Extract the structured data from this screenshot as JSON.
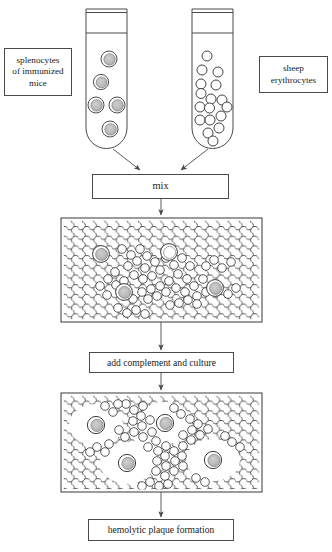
{
  "figure": {
    "type": "flow-diagram"
  },
  "labels": {
    "splenocytes_line1": "splenocytes",
    "splenocytes_line2": "of immunized",
    "splenocytes_line3": "mice",
    "erythrocytes_line1": "sheep",
    "erythrocytes_line2": "erythrocytes",
    "mix": "mix",
    "add_complement": "add complement and culture",
    "hemolytic": "hemolytic plaque formation"
  },
  "colors": {
    "stroke": "#4a4a4a",
    "cell_stroke": "#3a3a3a",
    "splenocyte_fill": "#b9b9b9",
    "erythrocyte_fill": "#ffffff",
    "background": "#ffffff",
    "text": "#1b1b1b"
  },
  "tubes": [
    {
      "name": "splenocyte-tube",
      "x": 86,
      "y": 9,
      "width": 41,
      "height": 139,
      "rim_y": 12,
      "neck_y": 33,
      "cell_type": "splenocyte",
      "cell_count": 5,
      "cells": [
        {
          "cx": 109,
          "cy": 59,
          "r": 8
        },
        {
          "cx": 101,
          "cy": 82,
          "r": 7.5
        },
        {
          "cx": 96,
          "cy": 105,
          "r": 8
        },
        {
          "cx": 117,
          "cy": 105,
          "r": 8
        },
        {
          "cx": 110,
          "cy": 129,
          "r": 8
        }
      ]
    },
    {
      "name": "erythrocyte-tube",
      "x": 192,
      "y": 9,
      "width": 41,
      "height": 139,
      "rim_y": 12,
      "neck_y": 33,
      "cell_type": "erythrocyte",
      "cell_count": 17,
      "cells": [
        {
          "cx": 207,
          "cy": 56,
          "r": 5
        },
        {
          "cx": 202,
          "cy": 70,
          "r": 5
        },
        {
          "cx": 218,
          "cy": 72,
          "r": 5
        },
        {
          "cx": 201,
          "cy": 84,
          "r": 5
        },
        {
          "cx": 201,
          "cy": 93,
          "r": 5
        },
        {
          "cx": 216,
          "cy": 85,
          "r": 5
        },
        {
          "cx": 211,
          "cy": 99,
          "r": 5
        },
        {
          "cx": 222,
          "cy": 100,
          "r": 5
        },
        {
          "cx": 200,
          "cy": 107,
          "r": 5
        },
        {
          "cx": 209,
          "cy": 108,
          "r": 5
        },
        {
          "cx": 227,
          "cy": 107,
          "r": 5
        },
        {
          "cx": 200,
          "cy": 120,
          "r": 5
        },
        {
          "cx": 210,
          "cy": 120,
          "r": 5
        },
        {
          "cx": 221,
          "cy": 116,
          "r": 5
        },
        {
          "cx": 219,
          "cy": 128,
          "r": 5
        },
        {
          "cx": 208,
          "cy": 133,
          "r": 5
        },
        {
          "cx": 213,
          "cy": 141,
          "r": 5
        }
      ]
    }
  ],
  "plates": [
    {
      "name": "plate-mixed-monolayer",
      "x": 61,
      "y": 218,
      "width": 201,
      "height": 104,
      "description": "confluent erythrocyte monolayer with splenocytes dispersed",
      "splenocytes": [
        {
          "cx": 101,
          "cy": 254,
          "r": 8
        },
        {
          "cx": 169,
          "cy": 252,
          "r": 8
        },
        {
          "cx": 124,
          "cy": 292,
          "r": 8
        },
        {
          "cx": 215,
          "cy": 288,
          "r": 8
        }
      ]
    },
    {
      "name": "plate-plaques",
      "x": 61,
      "y": 393,
      "width": 201,
      "height": 99,
      "description": "clear hemolytic plaque zones surrounding antibody-secreting splenocytes",
      "splenocytes": [
        {
          "cx": 96,
          "cy": 425,
          "r": 8
        },
        {
          "cx": 165,
          "cy": 423,
          "r": 8
        },
        {
          "cx": 127,
          "cy": 463,
          "r": 8
        },
        {
          "cx": 213,
          "cy": 460,
          "r": 8
        }
      ],
      "plaques": [
        {
          "cx": 96,
          "cy": 425,
          "rx": 26,
          "ry": 20
        },
        {
          "cx": 165,
          "cy": 423,
          "rx": 26,
          "ry": 20
        },
        {
          "cx": 127,
          "cy": 463,
          "rx": 26,
          "ry": 20
        },
        {
          "cx": 213,
          "cy": 460,
          "rx": 26,
          "ry": 20
        }
      ]
    }
  ],
  "arrows": [
    {
      "name": "arrow-splenocyte-to-mix",
      "type": "diagonal",
      "x1": 115,
      "y1": 150,
      "x2": 140,
      "y2": 170
    },
    {
      "name": "arrow-erythrocyte-to-mix",
      "type": "diagonal",
      "x1": 206,
      "y1": 150,
      "x2": 181,
      "y2": 170
    },
    {
      "name": "arrow-mix-to-plate1",
      "type": "vertical",
      "x1": 161,
      "y1": 199,
      "x2": 161,
      "y2": 216
    },
    {
      "name": "arrow-plate1-to-complement",
      "type": "vertical",
      "x1": 161,
      "y1": 322,
      "x2": 161,
      "y2": 350
    },
    {
      "name": "arrow-complement-to-plate2",
      "type": "vertical",
      "x1": 161,
      "y1": 373,
      "x2": 161,
      "y2": 391
    },
    {
      "name": "arrow-plate2-to-hemolytic",
      "type": "vertical",
      "x1": 161,
      "y1": 492,
      "x2": 161,
      "y2": 517
    }
  ]
}
